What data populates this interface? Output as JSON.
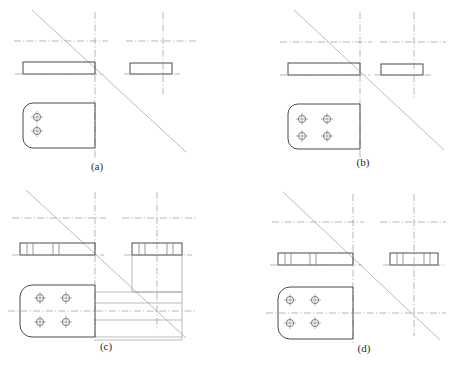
{
  "figure": {
    "background_color": "#ffffff",
    "line_color": "#4a4a4a",
    "center_line_color": "#9a9a9a",
    "miter_line_color": "#a9a9a9",
    "width": 450,
    "height": 368
  },
  "panels": [
    {
      "id": "a",
      "label": "(a)",
      "label_x": 97,
      "label_y": 170,
      "description": "Front view bar, side view bar, plan view plate with two holes in one column",
      "hole_count": 2,
      "hole_columns": 1,
      "hole_rows": 2,
      "front_bar": {
        "x": 23,
        "y": 62,
        "w": 72,
        "h": 12
      },
      "side_bar": {
        "x": 130,
        "y": 63,
        "w": 42,
        "h": 11
      },
      "plan_plate": {
        "x": 23,
        "y": 103,
        "w": 72,
        "h": 45,
        "corner_radius": 10
      },
      "holes": [
        {
          "cx": 37,
          "cy": 117,
          "r": 3.6
        },
        {
          "cx": 37,
          "cy": 131,
          "r": 3.6
        }
      ],
      "vertical_center_x": [
        95,
        163
      ],
      "horizontal_center_y": 41,
      "miter_line": {
        "x1": 32,
        "y1": 10,
        "x2": 186,
        "y2": 152
      }
    },
    {
      "id": "b",
      "label": "(b)",
      "label_x": 363,
      "label_y": 166,
      "description": "Front view bar, side view bar, plan view plate with four holes in two columns",
      "hole_count": 4,
      "hole_columns": 2,
      "hole_rows": 2,
      "front_bar": {
        "x": 288,
        "y": 63,
        "w": 72,
        "h": 12
      },
      "side_bar": {
        "x": 381,
        "y": 64,
        "w": 42,
        "h": 11
      },
      "plan_plate": {
        "x": 288,
        "y": 104,
        "w": 72,
        "h": 45,
        "corner_radius": 10
      },
      "holes": [
        {
          "cx": 302,
          "cy": 119,
          "r": 3.6
        },
        {
          "cx": 327,
          "cy": 119,
          "r": 3.6
        },
        {
          "cx": 302,
          "cy": 136,
          "r": 3.6
        },
        {
          "cx": 327,
          "cy": 136,
          "r": 3.6
        }
      ],
      "vertical_center_x": [
        360,
        414
      ],
      "horizontal_center_y": 42,
      "miter_line": {
        "x1": 294,
        "y1": 10,
        "x2": 444,
        "y2": 150
      }
    },
    {
      "id": "c",
      "label": "(c)",
      "label_x": 106,
      "label_y": 350,
      "description": "Angle bracket with projection construction lines and L-shaped side view",
      "hole_count": 4,
      "hole_columns": 2,
      "hole_rows": 2,
      "front_bar": {
        "x": 20,
        "y": 243,
        "w": 75,
        "h": 12
      },
      "side_bar": {
        "x": 132,
        "y": 243,
        "w": 50,
        "h": 12
      },
      "plan_plate": {
        "x": 20,
        "y": 285,
        "w": 75,
        "h": 52,
        "corner_radius": 12
      },
      "holes": [
        {
          "cx": 40,
          "cy": 298,
          "r": 3.6
        },
        {
          "cx": 66,
          "cy": 298,
          "r": 3.6
        },
        {
          "cx": 40,
          "cy": 322,
          "r": 3.6
        },
        {
          "cx": 66,
          "cy": 322,
          "r": 3.6
        }
      ],
      "vertical_center_x": [
        95,
        157
      ],
      "horizontal_center_y": 218,
      "plan_horizontal_center_y": 311,
      "miter_line": {
        "x1": 26,
        "y1": 190,
        "x2": 186,
        "y2": 338
      },
      "has_projection_lines": true
    },
    {
      "id": "d",
      "label": "(d)",
      "label_x": 364,
      "label_y": 352,
      "description": "Front view bar with hole lines, side view bar with hole lines, plan view plate with four holes",
      "hole_count": 4,
      "hole_columns": 2,
      "hole_rows": 2,
      "front_bar": {
        "x": 278,
        "y": 253,
        "w": 75,
        "h": 12
      },
      "side_bar": {
        "x": 390,
        "y": 253,
        "w": 48,
        "h": 12
      },
      "plan_plate": {
        "x": 278,
        "y": 287,
        "w": 75,
        "h": 52,
        "corner_radius": 12
      },
      "holes": [
        {
          "cx": 290,
          "cy": 300,
          "r": 3.6
        },
        {
          "cx": 315,
          "cy": 300,
          "r": 3.6
        },
        {
          "cx": 290,
          "cy": 323,
          "r": 3.6
        },
        {
          "cx": 315,
          "cy": 323,
          "r": 3.6
        }
      ],
      "vertical_center_x": [
        353,
        414
      ],
      "horizontal_center_y": 222,
      "plan_horizontal_center_y": 313,
      "miter_line": {
        "x1": 283,
        "y1": 192,
        "x2": 440,
        "y2": 340
      }
    }
  ]
}
